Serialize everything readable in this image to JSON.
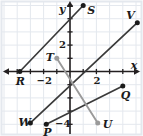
{
  "figure": {
    "kind": "coordinate-plane-line-graph",
    "width": 143,
    "height": 136,
    "background_color": "#ffffff",
    "grid_color": "#e4e8ee",
    "axis_color": "#231f20",
    "line_color_dark": "#3a3a3a",
    "line_color_gray": "#9a9a9a",
    "point_color_dark": "#1b1b1b",
    "point_color_gray": "#9a9a9a"
  },
  "axes": {
    "x_label": "x",
    "y_label": "y",
    "x_ticks": [
      {
        "value": -2,
        "label": "−2"
      },
      {
        "value": 2,
        "label": "2"
      }
    ],
    "y_ticks": [
      {
        "value": 2,
        "label": "2"
      },
      {
        "value": -4,
        "label": "−4"
      }
    ],
    "xlim": [
      -5.3,
      5.5
    ],
    "ylim": [
      -5.0,
      5.3
    ],
    "grid": true
  },
  "chart_data": {
    "type": "scatter",
    "title": "",
    "xlabel": "x",
    "ylabel": "y",
    "xlim": [
      -5.3,
      5.5
    ],
    "ylim": [
      -5.0,
      5.3
    ],
    "grid": true,
    "points": [
      {
        "name": "S",
        "x": 1.0,
        "y": 5.0,
        "label": "S",
        "color": "#1b1b1b"
      },
      {
        "name": "V",
        "x": 5.1,
        "y": 3.7,
        "label": "V",
        "color": "#1b1b1b"
      },
      {
        "name": "T",
        "x": -1.0,
        "y": 1.0,
        "label": "T",
        "color": "#9a9a9a"
      },
      {
        "name": "R",
        "x": -3.8,
        "y": 0.0,
        "label": "R",
        "color": "#1b1b1b"
      },
      {
        "name": "Q",
        "x": 4.0,
        "y": -1.1,
        "label": "Q",
        "color": "#1b1b1b"
      },
      {
        "name": "U",
        "x": 2.1,
        "y": -3.9,
        "label": "U",
        "color": "#9a9a9a"
      },
      {
        "name": "W",
        "x": -3.0,
        "y": -3.9,
        "label": "W",
        "color": "#1b1b1b"
      },
      {
        "name": "P",
        "x": -1.8,
        "y": -4.0,
        "label": "P",
        "color": "#1b1b1b"
      }
    ],
    "segments": [
      {
        "name": "RS",
        "from": "R",
        "to": "S",
        "x1": -3.8,
        "y1": 0.0,
        "x2": 1.0,
        "y2": 5.0,
        "color": "#3a3a3a"
      },
      {
        "name": "WV",
        "from": "W",
        "to": "V",
        "x1": -3.0,
        "y1": -3.9,
        "x2": 5.1,
        "y2": 3.7,
        "color": "#3a3a3a"
      },
      {
        "name": "PQ",
        "from": "P",
        "to": "Q",
        "x1": -1.8,
        "y1": -4.0,
        "x2": 4.0,
        "y2": -1.1,
        "color": "#3a3a3a"
      },
      {
        "name": "TU",
        "from": "T",
        "to": "U",
        "x1": -1.0,
        "y1": 1.0,
        "x2": 2.1,
        "y2": -3.9,
        "color": "#9a9a9a"
      }
    ],
    "series": [
      {
        "name": "labeled points",
        "values": [
          5.0,
          3.7,
          1.0,
          0.0,
          -1.1,
          -3.9,
          -3.9,
          -4.0
        ]
      }
    ],
    "categories": [
      "S",
      "V",
      "T",
      "R",
      "Q",
      "U",
      "W",
      "P"
    ]
  }
}
